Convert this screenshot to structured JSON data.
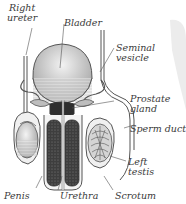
{
  "diagram": {
    "labels": {
      "right_ureter_line1": "Right",
      "right_ureter_line2": "ureter",
      "bladder": "Bladder",
      "seminal_vesicle_line1": "Seminal",
      "seminal_vesicle_line2": "vesicle",
      "prostate_line1": "Prostate",
      "prostate_line2": "gland",
      "sperm_duct": "Sperm duct",
      "left_testis_line1": "Left",
      "left_testis_line2": "testis",
      "penis": "Penis",
      "urethra": "Urethra",
      "scrotum": "Scrotum"
    },
    "colors": {
      "outline": "#555555",
      "fill_light": "#d8d8d8",
      "fill_dark": "#4a4a4a",
      "label": "#3a3a3a"
    }
  }
}
